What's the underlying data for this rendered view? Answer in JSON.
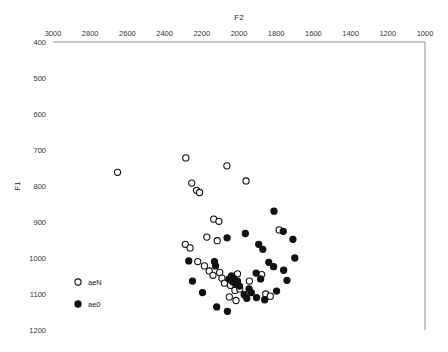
{
  "chart_data": {
    "type": "scatter",
    "title": "",
    "xlabel": "F2",
    "ylabel": "F1",
    "xlim": [
      3000,
      1000
    ],
    "ylim": [
      400,
      1200
    ],
    "x_axis_reversed": true,
    "y_axis_reversed": true,
    "x_axis_position": "top",
    "y_axis_position": "left",
    "grid": false,
    "xticks": [
      3000,
      2800,
      2600,
      2400,
      2200,
      2000,
      1800,
      1600,
      1400,
      1200,
      1000
    ],
    "yticks": [
      400,
      500,
      600,
      700,
      800,
      900,
      1000,
      1100,
      1200
    ],
    "legend": {
      "position": "left-inside",
      "entries": [
        {
          "name": "aeN",
          "marker": "open-circle"
        },
        {
          "name": "ae0",
          "marker": "filled-circle"
        }
      ]
    },
    "series": [
      {
        "name": "aeN",
        "marker": "open-circle",
        "points": [
          [
            2653,
            762
          ],
          [
            2286,
            722
          ],
          [
            2254,
            792
          ],
          [
            2228,
            812
          ],
          [
            2212,
            818
          ],
          [
            2065,
            744
          ],
          [
            1962,
            786
          ],
          [
            2136,
            892
          ],
          [
            2108,
            898
          ],
          [
            2289,
            962
          ],
          [
            2263,
            972
          ],
          [
            2173,
            942
          ],
          [
            2117,
            952
          ],
          [
            2222,
            1010
          ],
          [
            2186,
            1022
          ],
          [
            2160,
            1036
          ],
          [
            2140,
            1048
          ],
          [
            2104,
            1040
          ],
          [
            2092,
            1056
          ],
          [
            2078,
            1070
          ],
          [
            2046,
            1076
          ],
          [
            2022,
            1090
          ],
          [
            1996,
            1086
          ],
          [
            2008,
            1044
          ],
          [
            1944,
            1064
          ],
          [
            1878,
            1046
          ],
          [
            1856,
            1100
          ],
          [
            1832,
            1106
          ],
          [
            1784,
            922
          ],
          [
            2052,
            1108
          ],
          [
            2016,
            1118
          ]
        ]
      },
      {
        "name": "ae0",
        "marker": "filled-circle",
        "points": [
          [
            1812,
            870
          ],
          [
            1762,
            926
          ],
          [
            1966,
            932
          ],
          [
            1894,
            962
          ],
          [
            1872,
            976
          ],
          [
            2064,
            944
          ],
          [
            2270,
            1008
          ],
          [
            1840,
            1012
          ],
          [
            1814,
            1024
          ],
          [
            2054,
            1058
          ],
          [
            2040,
            1050
          ],
          [
            2034,
            1066
          ],
          [
            2026,
            1058
          ],
          [
            2018,
            1072
          ],
          [
            2008,
            1064
          ],
          [
            1998,
            1078
          ],
          [
            1946,
            1086
          ],
          [
            1934,
            1096
          ],
          [
            1908,
            1042
          ],
          [
            1884,
            1058
          ],
          [
            1760,
            1034
          ],
          [
            1742,
            1062
          ],
          [
            2132,
            1010
          ],
          [
            2126,
            1022
          ],
          [
            1972,
            1102
          ],
          [
            1958,
            1112
          ],
          [
            1906,
            1110
          ],
          [
            1862,
            1116
          ],
          [
            1798,
            1092
          ],
          [
            2120,
            1136
          ],
          [
            2062,
            1148
          ],
          [
            2196,
            1096
          ],
          [
            2250,
            1064
          ],
          [
            1700,
            1000
          ],
          [
            1710,
            948
          ]
        ]
      }
    ]
  },
  "axes": {
    "x_title": "F2",
    "y_title": "F1"
  }
}
